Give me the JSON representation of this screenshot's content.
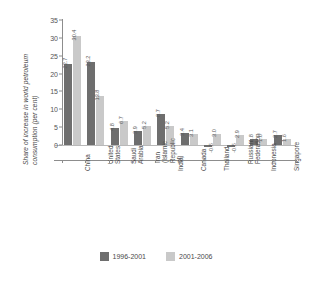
{
  "chart_data": {
    "type": "bar",
    "title": "",
    "subtitle": "",
    "xlabel": "",
    "ylabel": "Share of increase in world petroleum\nconsumption (per cent)",
    "ylim": [
      -5,
      35
    ],
    "yticks": [
      0,
      5,
      10,
      15,
      20,
      25,
      30,
      35
    ],
    "ytick_labels": [
      "0",
      "5",
      "10",
      "15",
      "20",
      "25",
      "30",
      "35"
    ],
    "grid": false,
    "legend_position": "bottom",
    "categories": [
      "China",
      "United States",
      "Saudi Arabia",
      "Iran (Islamic\nRepublic of)",
      "India",
      "Canada",
      "Thailand",
      "Russian\nFederation",
      "Indonesia",
      "Singapore"
    ],
    "series": [
      {
        "name": "1996-2001",
        "color": "#6e6e6e",
        "values": [
          22.7,
          23.2,
          4.8,
          3.9,
          8.7,
          3.4,
          -0.5,
          -0.5,
          1.8,
          2.7
        ],
        "labels": [
          "22.7",
          "23.2",
          "4.8",
          "3.9",
          "8.7",
          "3.4",
          "-0.5",
          "-0.5",
          "1.8",
          "2.7"
        ]
      },
      {
        "name": "2001-2006",
        "color": "#c9c9c9",
        "values": [
          30.4,
          13.8,
          6.7,
          5.2,
          5.2,
          3.1,
          3.0,
          2.9,
          1.6,
          1.6
        ],
        "labels": [
          "30.4",
          "13.8",
          "6.7",
          "5.2",
          "5.2",
          "3.1",
          "3.0",
          "2.9",
          "1.6",
          "1.6"
        ]
      }
    ]
  },
  "legend": {
    "items": [
      {
        "label": "1996-2001",
        "color": "#6e6e6e"
      },
      {
        "label": "2001-2006",
        "color": "#c9c9c9"
      }
    ]
  }
}
